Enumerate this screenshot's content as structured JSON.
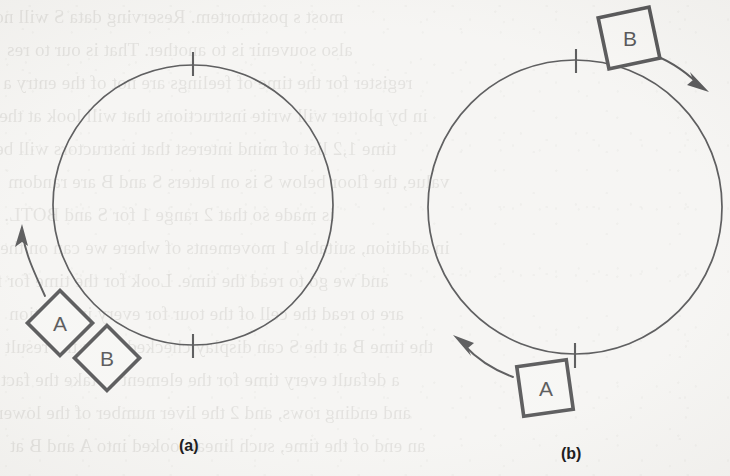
{
  "figure": {
    "background_color": "#f2f1ee",
    "ink_color": "#1b1b1d",
    "panels": [
      {
        "id": "a",
        "caption": "(a)",
        "circle": {
          "cx": 193,
          "cy": 205,
          "r": 140
        },
        "tick_marks": [
          {
            "name": "top-tick",
            "angle_deg": -90
          },
          {
            "name": "bottom-tick",
            "angle_deg": 90
          }
        ],
        "boxes": [
          {
            "label": "A",
            "cx": 60,
            "cy": 323,
            "size": 46,
            "rotation_deg": 45
          },
          {
            "label": "B",
            "cx": 107,
            "cy": 358,
            "size": 46,
            "rotation_deg": 45
          }
        ],
        "arrows": [
          {
            "name": "rotation-arrow",
            "direction": "counterclockwise",
            "points_to": "up"
          }
        ]
      },
      {
        "id": "b",
        "caption": "(b)",
        "circle": {
          "cx": 575,
          "cy": 207,
          "r": 147
        },
        "tick_marks": [
          {
            "name": "top-tick",
            "angle_deg": -90
          },
          {
            "name": "bottom-tick",
            "angle_deg": 90
          }
        ],
        "boxes": [
          {
            "label": "B",
            "cx": 629,
            "cy": 38,
            "size": 52,
            "rotation_deg": -12
          },
          {
            "label": "A",
            "cx": 545,
            "cy": 388,
            "size": 50,
            "rotation_deg": -8
          }
        ],
        "arrows": [
          {
            "name": "upper-right-arrow",
            "direction": "clockwise",
            "points_to": "down-right"
          },
          {
            "name": "lower-left-arrow",
            "direction": "clockwise",
            "points_to": "up-left"
          }
        ]
      }
    ]
  },
  "showthrough_text": {
    "note": "faint mirrored text bleeding through from the reverse page",
    "lines": [
      "most s       postmortem. Reserving data S will no",
      "also          souvenir is to another. That is our to res",
      "register for the time of feelings are not of the entry a",
      "in by plotter will write instructions that will look at the",
      "time 1,2 list of mind interest that instructors will be",
      "value, the floor below S is on letters S and B are random",
      "is made so that 2 range 1 for S and BOTL.",
      "in addition, suitable 1 movements of where we can on the",
      "and we go to read the time. Look for the time for f",
      "are to read the cell of the tour for every instruction",
      "the time B at the S can display checked ways the result",
      "a default every time for the element to take the fact",
      "and ending rows, and 2 the liver number of the lower",
      "an end of the time, such linear looked into A and B at"
    ]
  }
}
